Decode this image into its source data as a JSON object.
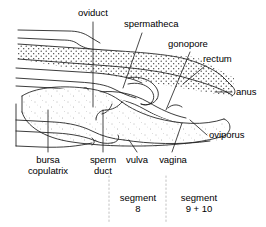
{
  "figure": {
    "line_color": "#1a1a1a",
    "stipple_color": "#2a2a2a",
    "divider_color": "#b9b9b9",
    "background": "#ffffff"
  },
  "labels": {
    "oviduct": "oviduct",
    "spermatheca": "spermatheca",
    "gonopore": "gonopore",
    "rectum": "rectum",
    "anus": "anus",
    "oviporus": "oviporus",
    "vagina": "vagina",
    "vulva": "vulva",
    "sperm_duct_line1": "sperm",
    "sperm_duct_line2": "duct",
    "bursa_line1": "bursa",
    "bursa_line2": "copulatrix"
  },
  "segments": [
    {
      "line1": "segment",
      "line2": "8"
    },
    {
      "line1": "segment",
      "line2": "9 + 10"
    }
  ]
}
